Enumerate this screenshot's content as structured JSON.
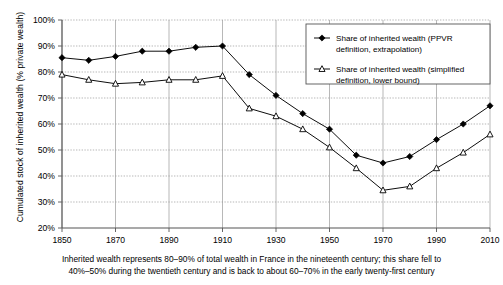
{
  "chart_data": {
    "type": "line",
    "title": "",
    "xlabel": "",
    "ylabel": "Cumulated stock of inherited wealth (% private wealth)",
    "xlim": [
      1850,
      2010
    ],
    "ylim": [
      20,
      100
    ],
    "xticks": [
      1850,
      1870,
      1890,
      1910,
      1930,
      1950,
      1970,
      1990,
      2010
    ],
    "xtick_labels": [
      "1850",
      "1870",
      "1890",
      "1910",
      "1930",
      "1950",
      "1970",
      "1990",
      "2010"
    ],
    "yticks": [
      20,
      30,
      40,
      50,
      60,
      70,
      80,
      90,
      100
    ],
    "ytick_labels": [
      "20%",
      "30%",
      "40%",
      "50%",
      "60%",
      "70%",
      "80%",
      "90%",
      "100%"
    ],
    "grid": true,
    "legend_position": "top-right",
    "x": [
      1850,
      1860,
      1870,
      1880,
      1890,
      1900,
      1910,
      1920,
      1930,
      1940,
      1950,
      1960,
      1970,
      1980,
      1990,
      2000,
      2010
    ],
    "series": [
      {
        "name": "Share of inherited wealth (PPVR definition, extrapolation)",
        "marker": "filled-diamond",
        "color": "#000000",
        "values": [
          85.5,
          84.5,
          86,
          88,
          88,
          89.5,
          90,
          79,
          71,
          64,
          58,
          48,
          45,
          47.5,
          54,
          60,
          67
        ]
      },
      {
        "name": "Share of inherited wealth (simplified definition, lower bound)",
        "marker": "open-triangle",
        "color": "#000000",
        "values": [
          79,
          77,
          75.5,
          76,
          77,
          77,
          78.5,
          66,
          63,
          58,
          51,
          43,
          34.5,
          36,
          43,
          49,
          56
        ]
      }
    ],
    "caption": [
      "Inherited wealth represents 80–90% of total wealth in France in the nineteenth century; this share fell to",
      "40%–50% during the twentieth century and is back to about 60–70% in the early twenty-first century"
    ]
  },
  "legend": {
    "entries": [
      {
        "line1": "Share of inherited wealth (PPVR",
        "line2": "definition, extrapolation)"
      },
      {
        "line1": "Share of inherited wealth (simplified",
        "line2": "definition, lower bound)"
      }
    ]
  }
}
